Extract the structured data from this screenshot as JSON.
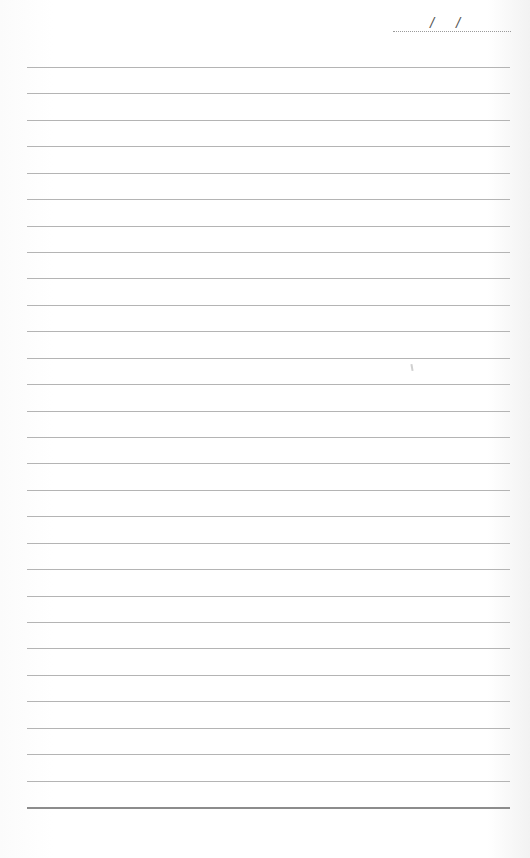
{
  "page": {
    "type": "lined-notebook-page",
    "date_field": {
      "separator_1": "/",
      "separator_2": "/",
      "value": ""
    },
    "ruled_lines": {
      "count": 29,
      "first_y": 67,
      "spacing": 26.43,
      "left_x": 27,
      "width": 483,
      "line_color": "#b4b4b4",
      "bottom_line_color": "#8c8c8c"
    },
    "background_color": "#fdfdfd"
  }
}
